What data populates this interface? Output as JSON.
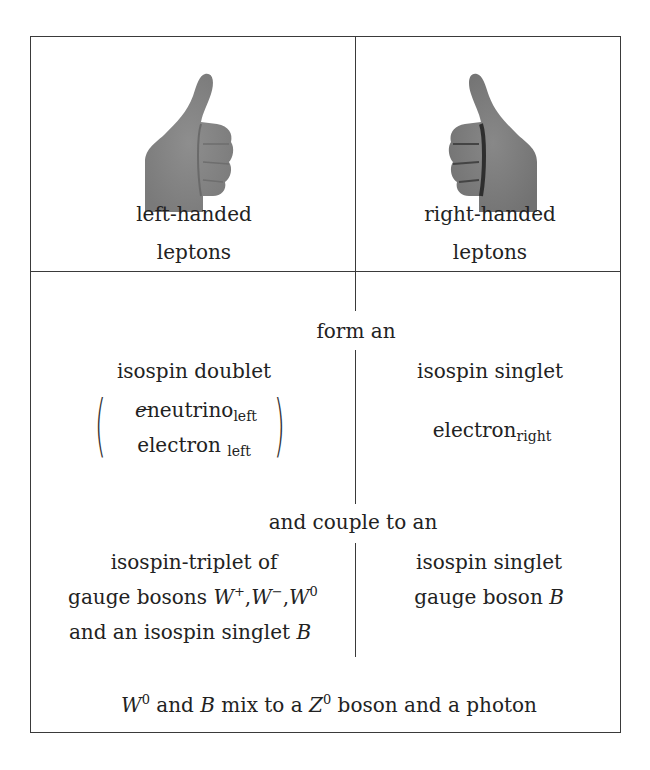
{
  "header": {
    "left": {
      "icon": "thumbs-up-left-hand-icon",
      "line1": "left-handed",
      "line2": "leptons"
    },
    "right": {
      "icon": "thumbs-up-right-hand-icon",
      "line1": "right-handed",
      "line2": "leptons"
    }
  },
  "form": {
    "connector": "form an",
    "left": {
      "title": "isospin doublet",
      "top_entry": {
        "prefix": "e",
        "main": "neutrino",
        "sub": "left"
      },
      "bottom_entry": {
        "main": "electron",
        "sub": "left"
      }
    },
    "right": {
      "title": "isospin singlet",
      "entry": {
        "main": "electron",
        "sub": "right"
      }
    }
  },
  "couple": {
    "connector": "and couple to an",
    "left": {
      "line1": "isospin-triplet of",
      "line2_text": "gauge bosons ",
      "bosons": [
        {
          "sym": "W",
          "sup": "+"
        },
        {
          "sym": "W",
          "sup": "−"
        },
        {
          "sym": "W",
          "sup": "0"
        }
      ],
      "line3_text": "and an isospin singlet ",
      "line3_sym": "B"
    },
    "right": {
      "line1": "isospin singlet",
      "line2_text": "gauge boson ",
      "line2_sym": "B"
    }
  },
  "footer": {
    "w_sym": "W",
    "w_sup": "0",
    "text1": " and ",
    "b_sym": "B",
    "text2": " mix to a ",
    "z_sym": "Z",
    "z_sup": "0",
    "text3": " boson and a photon"
  },
  "colors": {
    "line": "#3a3a3a",
    "text": "#222222",
    "hand": "#8a8a8a"
  }
}
